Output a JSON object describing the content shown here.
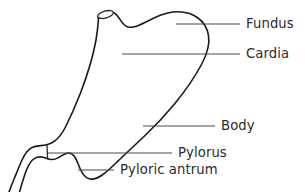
{
  "diagram": {
    "line_color": "#1a1a1a",
    "leader_color": "#4a4a4a",
    "text_color": "#2b2b2b",
    "background_color": "#ffffff",
    "labels": [
      {
        "id": "fundus",
        "text": "Fundus",
        "text_x": 246,
        "text_y": 17,
        "leader": {
          "x1": 176,
          "y1": 24,
          "x2": 240,
          "y2": 24
        }
      },
      {
        "id": "cardia",
        "text": "Cardia",
        "text_x": 246,
        "text_y": 47,
        "leader": {
          "x1": 122,
          "y1": 54,
          "x2": 240,
          "y2": 54
        }
      },
      {
        "id": "body",
        "text": "Body",
        "text_x": 221,
        "text_y": 119,
        "leader": {
          "x1": 143,
          "y1": 126,
          "x2": 215,
          "y2": 126
        }
      },
      {
        "id": "pylorus",
        "text": "Pylorus",
        "text_x": 178,
        "text_y": 146,
        "leader": {
          "x1": 48,
          "y1": 153,
          "x2": 172,
          "y2": 153
        }
      },
      {
        "id": "pyloric-antrum",
        "text": "Pyloric antrum",
        "text_x": 120,
        "text_y": 163,
        "leader": {
          "x1": 78,
          "y1": 170,
          "x2": 114,
          "y2": 170
        }
      }
    ],
    "parts": [
      {
        "id": "esophagus-stump",
        "name": "esophagus-stump"
      },
      {
        "id": "greater-curvature",
        "name": "greater-curvature"
      },
      {
        "id": "lesser-curvature",
        "name": "lesser-curvature"
      },
      {
        "id": "duodenum-upper",
        "name": "duodenum-upper-wall"
      },
      {
        "id": "duodenum-lower",
        "name": "duodenum-lower-wall"
      },
      {
        "id": "pyloric-marker",
        "name": "pyloric-sphincter-marker"
      }
    ]
  }
}
